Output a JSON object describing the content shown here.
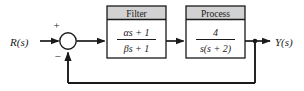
{
  "diagram": {
    "type": "control-system-block-diagram",
    "title": "",
    "ink_color": "#1a1a1a",
    "header_fill": "#d2d2d2",
    "body_fill": "#ffffff",
    "background": "#ffffff"
  },
  "signals": {
    "input_label": "R(s)",
    "output_label": "Y(s)"
  },
  "summing_junction": {
    "name": "summing-junction",
    "plus_sign": "+",
    "minus_sign": "−",
    "plus_input": "reference",
    "minus_input": "feedback"
  },
  "blocks": [
    {
      "id": "filter",
      "title": "Filter",
      "numerator": "αs + 1",
      "denominator": "βs + 1",
      "transfer_function": "(αs + 1)/(βs + 1)"
    },
    {
      "id": "process",
      "title": "Process",
      "numerator": "4",
      "denominator": "s(s + 2)",
      "transfer_function": "4/(s(s + 2))"
    }
  ],
  "feedback": {
    "name": "feedback-path",
    "gain": "1",
    "label": "",
    "sign": "−"
  },
  "takeoff_node": {
    "name": "output-takeoff-node"
  }
}
